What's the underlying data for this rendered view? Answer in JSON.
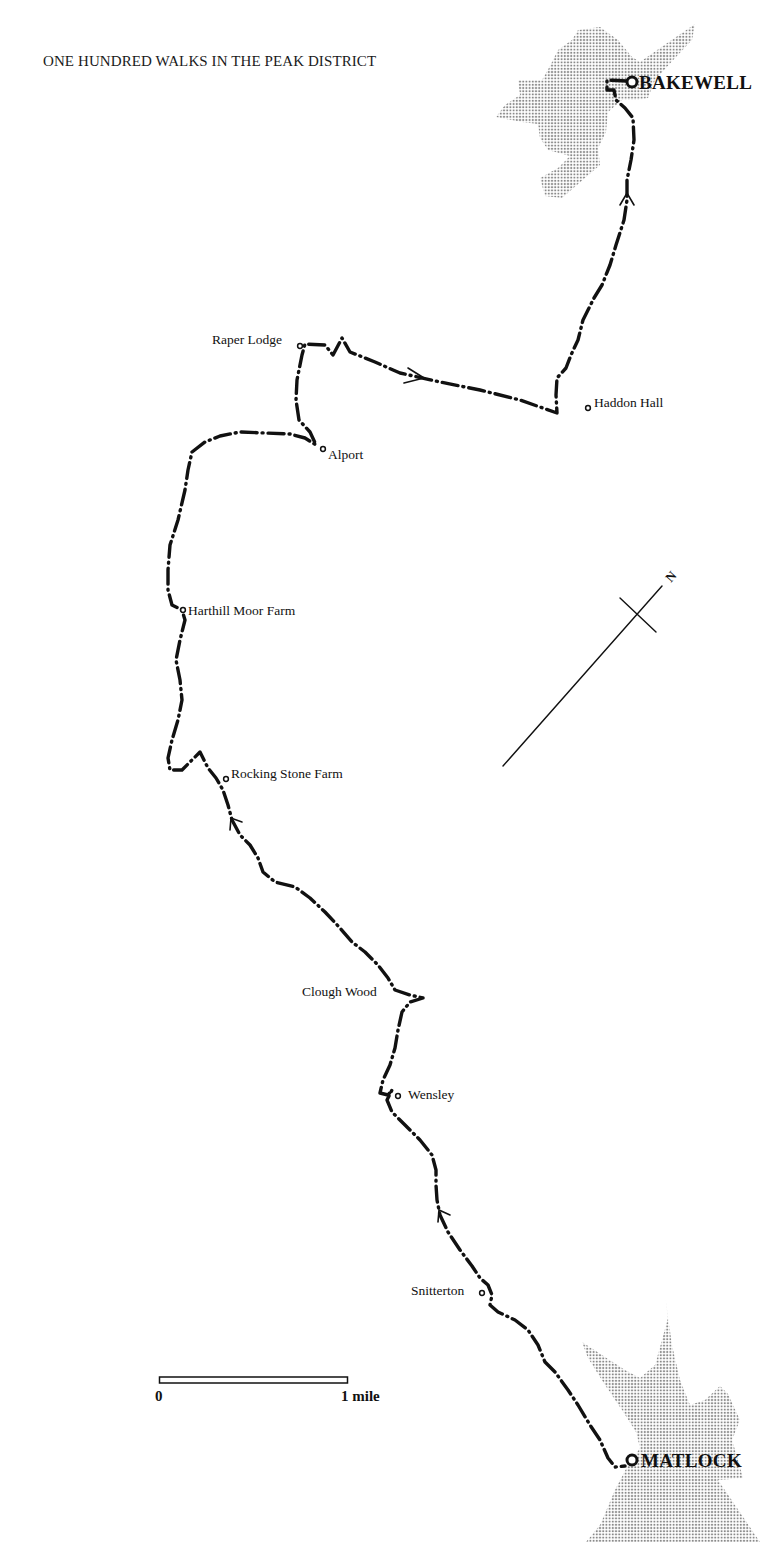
{
  "header": {
    "book_title": "ONE HUNDRED WALKS IN THE PEAK DISTRICT"
  },
  "map": {
    "type": "walking route map",
    "route_style": "dash-dot line with direction arrows",
    "colors": {
      "route": "#111111",
      "town_shading": "#9a9a9a",
      "background": "#ffffff"
    },
    "towns": [
      {
        "id": "bakewell",
        "label": "BAKEWELL",
        "role": "finish"
      },
      {
        "id": "matlock",
        "label": "MATLOCK",
        "role": "start"
      }
    ],
    "places": [
      {
        "id": "raper-lodge",
        "label": "Raper Lodge"
      },
      {
        "id": "haddon-hall",
        "label": "Haddon Hall"
      },
      {
        "id": "alport",
        "label": "Alport"
      },
      {
        "id": "harthill-moor-farm",
        "label": "Harthill Moor Farm"
      },
      {
        "id": "rocking-stone-farm",
        "label": "Rocking Stone Farm"
      },
      {
        "id": "clough-wood",
        "label": "Clough Wood"
      },
      {
        "id": "wensley",
        "label": "Wensley"
      },
      {
        "id": "snitterton",
        "label": "Snitterton"
      }
    ],
    "north_arrow": {
      "label": "N"
    },
    "scale_bar": {
      "start_label": "0",
      "end_label": "1 mile"
    },
    "direction_arrows": 5
  }
}
